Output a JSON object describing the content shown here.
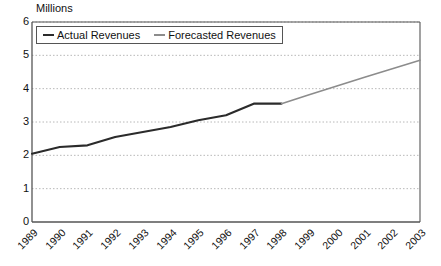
{
  "chart_data": {
    "type": "line",
    "title": "",
    "ylabel": "Millions",
    "xlabel": "",
    "ylim": [
      0,
      6
    ],
    "ytick_step": 1,
    "grid": true,
    "grid_style": "dotted-horizontal",
    "legend_position": "top-left-inside",
    "categories": [
      "1989",
      "1990",
      "1991",
      "1992",
      "1993",
      "1994",
      "1995",
      "1996",
      "1997",
      "1998",
      "1999",
      "2000",
      "2001",
      "2002",
      "2003"
    ],
    "yticks": [
      "0",
      "1",
      "2",
      "3",
      "4",
      "5",
      "6"
    ],
    "series": [
      {
        "name": "Actual Revenues",
        "color": "#2b2b2b",
        "x": [
          "1989",
          "1990",
          "1991",
          "1992",
          "1993",
          "1994",
          "1995",
          "1996",
          "1997",
          "1998"
        ],
        "values": [
          2.05,
          2.25,
          2.3,
          2.55,
          2.7,
          2.85,
          3.05,
          3.2,
          3.55,
          3.55
        ]
      },
      {
        "name": "Forecasted Revenues",
        "color": "#8c8c8c",
        "x": [
          "1998",
          "1999",
          "2000",
          "2001",
          "2002",
          "2003"
        ],
        "values": [
          3.55,
          3.82,
          4.08,
          4.34,
          4.6,
          4.85
        ]
      }
    ]
  },
  "axes": {
    "y_title": "Millions",
    "y_labels": [
      "6",
      "5",
      "4",
      "3",
      "2",
      "1",
      "0"
    ],
    "x_labels": [
      "1989",
      "1990",
      "1991",
      "1992",
      "1993",
      "1994",
      "1995",
      "1996",
      "1997",
      "1998",
      "1999",
      "2000",
      "2001",
      "2002",
      "2003"
    ]
  },
  "legend": {
    "items": [
      {
        "label": "Actual Revenues",
        "color": "#2b2b2b"
      },
      {
        "label": "Forecasted Revenues",
        "color": "#8c8c8c"
      }
    ]
  },
  "style": {
    "plot_border": "#555555",
    "gridline": "#b8b8b8",
    "background": "#ffffff",
    "text": "#111111"
  }
}
